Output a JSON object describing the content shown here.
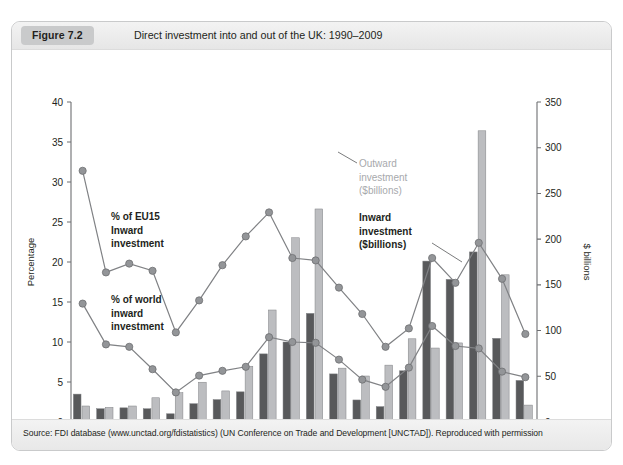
{
  "figure": {
    "tag": "Figure 7.2",
    "title": "Direct investment into and out of the UK: 1990–2009",
    "source": "Source: FDI database (www.unctad.org/fdistatistics) (UN Conference on Trade and Development [UNCTAD]). Reproduced with permission"
  },
  "annotations": {
    "eu15_line1": "% of EU15",
    "eu15_line2": "Inward",
    "eu15_line3": "investment",
    "world_line1": "% of world",
    "world_line2": "inward",
    "world_line3": "investment",
    "outward_line1": "Outward",
    "outward_line2": "investment",
    "outward_line3": "($billions)",
    "inward_line1": "Inward",
    "inward_line2": "investment",
    "inward_line3": "($billions)"
  },
  "colors": {
    "bar_inward": "#58595b",
    "bar_outward": "#bcbdc0",
    "line": "#808285",
    "marker": "#939598",
    "tag_bg": "#c9cacb",
    "frame": "#c9cacb",
    "text": "#231f20",
    "outward_label": "#a7a9ac"
  },
  "chart_data": {
    "type": "bar",
    "title": "Direct investment into and out of the UK: 1990–2009",
    "xlabel": "",
    "ylabel": "Percentage",
    "y2label": "$ billions",
    "ylim": [
      0,
      40
    ],
    "y2lim": [
      0,
      350
    ],
    "yticks": [
      0,
      5,
      10,
      15,
      20,
      25,
      30,
      35,
      40
    ],
    "y2ticks": [
      0,
      50,
      100,
      150,
      200,
      250,
      300,
      350
    ],
    "grid": false,
    "legend": "annotations-inline",
    "x": [
      1990,
      1991,
      1992,
      1993,
      1994,
      1995,
      1996,
      1997,
      1998,
      1999,
      2000,
      2001,
      2002,
      2003,
      2004,
      2005,
      2006,
      2007,
      2008,
      2009
    ],
    "xtick_labels": [
      "1990",
      "1992",
      "1994",
      "1996",
      "1998",
      "2000",
      "2002",
      "2004",
      "2006",
      "2008"
    ],
    "xticks": [
      1990,
      1992,
      1994,
      1996,
      1998,
      2000,
      2002,
      2004,
      2006,
      2008
    ],
    "series": [
      {
        "name": "Inward investment ($billions)",
        "type": "bar",
        "axis": "right",
        "unit": "$ billions",
        "color": "#58595b",
        "values": [
          30.5,
          14.5,
          15.5,
          14.5,
          9.0,
          20.0,
          24.5,
          33.0,
          74.5,
          87.5,
          118.8,
          52.6,
          24.1,
          16.8,
          56.0,
          176.0,
          156.0,
          186.0,
          91.5,
          45.5
        ]
      },
      {
        "name": "Outward investment ($billions)",
        "type": "bar",
        "axis": "right",
        "unit": "$ billions",
        "color": "#bcbdc0",
        "values": [
          17.5,
          16.0,
          17.5,
          26.5,
          32.0,
          43.5,
          34.0,
          61.0,
          122.5,
          201.5,
          233.0,
          58.9,
          50.3,
          62.2,
          91.0,
          80.9,
          86.5,
          318.5,
          161.0,
          18.5
        ]
      },
      {
        "name": "% of EU15 inward investment",
        "type": "line",
        "axis": "left",
        "unit": "%",
        "color": "#808285",
        "values": [
          31.4,
          18.7,
          19.8,
          18.9,
          11.2,
          15.2,
          19.6,
          23.2,
          26.2,
          20.5,
          20.2,
          16.8,
          13.5,
          9.4,
          11.7,
          20.5,
          17.4,
          22.4,
          17.9,
          11.0
        ]
      },
      {
        "name": "% of world inward investment",
        "type": "line",
        "axis": "left",
        "unit": "%",
        "color": "#808285",
        "values": [
          14.8,
          9.7,
          9.4,
          6.6,
          3.7,
          5.8,
          6.4,
          6.9,
          10.6,
          10.0,
          9.9,
          7.8,
          5.3,
          4.4,
          6.8,
          12.0,
          9.5,
          9.2,
          6.3,
          5.6
        ]
      }
    ]
  }
}
